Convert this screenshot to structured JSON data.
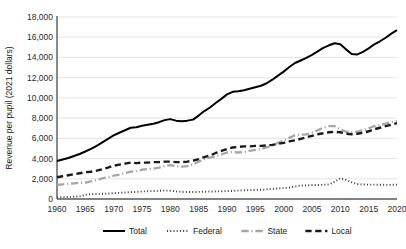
{
  "chart_data": {
    "type": "line",
    "title": "",
    "xlabel": "",
    "ylabel": "Revenue per pupil  (2021 dollars)",
    "xlim": [
      1960,
      2020
    ],
    "ylim": [
      0,
      18000
    ],
    "grid": true,
    "legend_position": "bottom",
    "ytick_labels": [
      "0",
      "2,000",
      "4,000",
      "6,000",
      "8,000",
      "10,000",
      "12,000",
      "14,000",
      "16,000",
      "18,000"
    ],
    "ytick_values": [
      0,
      2000,
      4000,
      6000,
      8000,
      10000,
      12000,
      14000,
      16000,
      18000
    ],
    "xtick_labels": [
      "1960",
      "1965",
      "1970",
      "1975",
      "1980",
      "1985",
      "1990",
      "1995",
      "2000",
      "2005",
      "2010",
      "2015",
      "2020"
    ],
    "xtick_values": [
      1960,
      1965,
      1970,
      1975,
      1980,
      1985,
      1990,
      1995,
      2000,
      2005,
      2010,
      2015,
      2020
    ],
    "x": [
      1960,
      1961,
      1962,
      1963,
      1964,
      1965,
      1966,
      1967,
      1968,
      1969,
      1970,
      1971,
      1972,
      1973,
      1974,
      1975,
      1976,
      1977,
      1978,
      1979,
      1980,
      1981,
      1982,
      1983,
      1984,
      1985,
      1986,
      1987,
      1988,
      1989,
      1990,
      1991,
      1992,
      1993,
      1994,
      1995,
      1996,
      1997,
      1998,
      1999,
      2000,
      2001,
      2002,
      2003,
      2004,
      2005,
      2006,
      2007,
      2008,
      2009,
      2010,
      2011,
      2012,
      2013,
      2014,
      2015,
      2016,
      2017,
      2018,
      2019,
      2020
    ],
    "series": [
      {
        "name": "Total",
        "color": "#000000",
        "style": "solid",
        "width": 2.0,
        "values": [
          3750,
          3900,
          4050,
          4250,
          4450,
          4700,
          4950,
          5250,
          5600,
          5950,
          6300,
          6550,
          6800,
          7050,
          7100,
          7250,
          7350,
          7450,
          7600,
          7800,
          7900,
          7750,
          7700,
          7750,
          7850,
          8250,
          8700,
          9050,
          9500,
          9900,
          10350,
          10600,
          10650,
          10750,
          10900,
          11050,
          11200,
          11450,
          11800,
          12200,
          12600,
          13050,
          13450,
          13700,
          13950,
          14250,
          14600,
          14950,
          15200,
          15400,
          15300,
          14800,
          14350,
          14300,
          14550,
          14900,
          15300,
          15600,
          15950,
          16350,
          16700
        ]
      },
      {
        "name": "Federal",
        "color": "#404040",
        "style": "dotted",
        "width": 1.9,
        "values": [
          160,
          180,
          200,
          230,
          260,
          420,
          470,
          500,
          520,
          540,
          580,
          610,
          650,
          680,
          700,
          740,
          770,
          790,
          810,
          830,
          820,
          760,
          700,
          690,
          690,
          700,
          720,
          730,
          750,
          760,
          780,
          800,
          830,
          860,
          880,
          900,
          920,
          950,
          1000,
          1050,
          1080,
          1130,
          1250,
          1320,
          1350,
          1380,
          1380,
          1400,
          1450,
          1700,
          2050,
          1900,
          1650,
          1480,
          1430,
          1420,
          1420,
          1410,
          1400,
          1400,
          1420
        ]
      },
      {
        "name": "State",
        "color": "#a6a6a6",
        "style": "dashdot",
        "width": 2.3,
        "values": [
          1400,
          1450,
          1500,
          1550,
          1600,
          1620,
          1750,
          1900,
          2050,
          2150,
          2300,
          2400,
          2550,
          2700,
          2750,
          2900,
          2950,
          3000,
          3100,
          3250,
          3350,
          3250,
          3200,
          3250,
          3400,
          3700,
          3950,
          4100,
          4250,
          4400,
          4600,
          4650,
          4600,
          4650,
          4750,
          4850,
          4950,
          5100,
          5300,
          5550,
          5800,
          6050,
          6300,
          6350,
          6400,
          6550,
          6800,
          7050,
          7200,
          7200,
          6900,
          6650,
          6600,
          6650,
          6800,
          7000,
          7200,
          7300,
          7450,
          7600,
          7700
        ]
      },
      {
        "name": "Local",
        "color": "#1a1a1a",
        "style": "dashed",
        "width": 2.4,
        "values": [
          2150,
          2250,
          2350,
          2450,
          2550,
          2650,
          2700,
          2800,
          2950,
          3100,
          3300,
          3400,
          3500,
          3600,
          3550,
          3600,
          3600,
          3650,
          3650,
          3700,
          3700,
          3650,
          3650,
          3700,
          3800,
          3950,
          4150,
          4300,
          4550,
          4750,
          4950,
          5100,
          5150,
          5200,
          5200,
          5250,
          5250,
          5300,
          5350,
          5450,
          5550,
          5700,
          5800,
          5950,
          6100,
          6250,
          6400,
          6500,
          6600,
          6650,
          6600,
          6450,
          6400,
          6450,
          6550,
          6700,
          6900,
          7050,
          7200,
          7350,
          7500
        ]
      }
    ]
  },
  "legend": {
    "items": [
      {
        "label": "Total"
      },
      {
        "label": "Federal"
      },
      {
        "label": "State"
      },
      {
        "label": "Local"
      }
    ]
  }
}
